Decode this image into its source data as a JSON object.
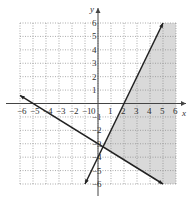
{
  "chart_data": {
    "type": "line",
    "title": "",
    "xlabel": "x",
    "ylabel": "y",
    "xlim": [
      -6,
      6
    ],
    "ylim": [
      -6,
      6
    ],
    "grid": true,
    "x_ticks": [
      "-6",
      "-5",
      "-4",
      "-3",
      "-2",
      "-1",
      "0",
      "1",
      "2",
      "3",
      "4",
      "5",
      "6"
    ],
    "y_ticks": [
      "6",
      "5",
      "4",
      "3",
      "2",
      "1",
      "-1",
      "-2",
      "-3",
      "-4",
      "-5",
      "-6"
    ],
    "series": [
      {
        "name": "y = 2x - 4",
        "x": [
          -1,
          5
        ],
        "y": [
          -6,
          6
        ],
        "style": "solid",
        "arrows": "both"
      },
      {
        "name": "y = -3/5 x - 3",
        "x": [
          -6,
          5
        ],
        "y": [
          0.6,
          -6
        ],
        "style": "solid",
        "arrows": "both"
      }
    ],
    "shaded_region": {
      "description": "y <= 2x - 4 and y >= -0.6x - 3",
      "vertices": [
        [
          0.385,
          -3.23
        ],
        [
          5,
          -6
        ],
        [
          6,
          -6
        ],
        [
          6,
          6
        ],
        [
          5,
          6
        ]
      ],
      "color": "#d9d9d9"
    }
  },
  "colors": {
    "line": "#222222",
    "grid": "#888888",
    "shade": "#d9d9d9"
  }
}
